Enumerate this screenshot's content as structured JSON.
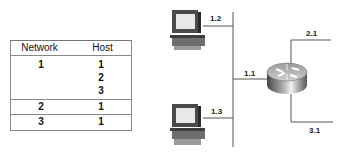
{
  "table": {
    "headers": {
      "network": "Network",
      "host": "Host"
    },
    "groups": [
      {
        "rows": [
          {
            "network": "1",
            "host": "1"
          },
          {
            "network": "",
            "host": "2"
          },
          {
            "network": "",
            "host": "3"
          }
        ]
      },
      {
        "rows": [
          {
            "network": "2",
            "host": "1"
          }
        ]
      },
      {
        "rows": [
          {
            "network": "3",
            "host": "1"
          }
        ]
      }
    ]
  },
  "diagram": {
    "hosts": [
      {
        "name": "pc-top",
        "address": "1.2"
      },
      {
        "name": "pc-bottom",
        "address": "1.3"
      }
    ],
    "router": {
      "interfaces": [
        {
          "name": "to-network-1",
          "address": "1.1"
        },
        {
          "name": "to-network-2",
          "address": "2.1"
        },
        {
          "name": "to-network-3",
          "address": "3.1"
        }
      ]
    },
    "colors": {
      "line": "#555555",
      "device_dark": "#3a3a3a",
      "device_mid": "#8a8a8a",
      "device_light": "#e4e4e4"
    }
  }
}
